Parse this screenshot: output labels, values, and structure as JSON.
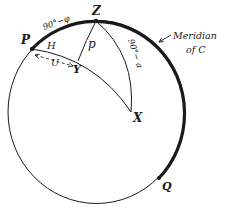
{
  "diagram": {
    "type": "celestial-sphere-spherical-triangle",
    "colors": {
      "ink": "#1a1a1a",
      "background": "#ffffff"
    },
    "sphere": {
      "cx": 96.5,
      "cy": 112,
      "rx": 88.5,
      "ry": 91.5
    },
    "points": {
      "Z": {
        "label": "Z",
        "x": 96,
        "y": 21
      },
      "P": {
        "label": "P",
        "x": 32,
        "y": 49
      },
      "Y": {
        "label": "Y",
        "x": 78,
        "y": 61
      },
      "X": {
        "label": "X",
        "x": 131,
        "y": 112
      },
      "Q": {
        "label": "Q",
        "x": 159,
        "y": 178
      }
    },
    "labels": {
      "colatitude": "90°−φ",
      "polar_distance": "p",
      "co_altitude": "90°− a",
      "hour_angle": "H",
      "arc_u": "U",
      "meridian_line1": "Meridian",
      "meridian_line2": "of C"
    },
    "edges": [
      {
        "from": "P",
        "to": "Q",
        "style": "thick",
        "name": "meridian-of-c"
      },
      {
        "from": "Z",
        "to": "Y",
        "style": "thin",
        "label": "p"
      },
      {
        "from": "Z",
        "to": "X",
        "style": "thin",
        "label": "90°− a"
      },
      {
        "from": "P",
        "to": "X",
        "style": "thin",
        "label": "H",
        "via": "Y"
      },
      {
        "from": "P",
        "to": "Y",
        "style": "dashed-arrow",
        "label": "U"
      }
    ]
  }
}
